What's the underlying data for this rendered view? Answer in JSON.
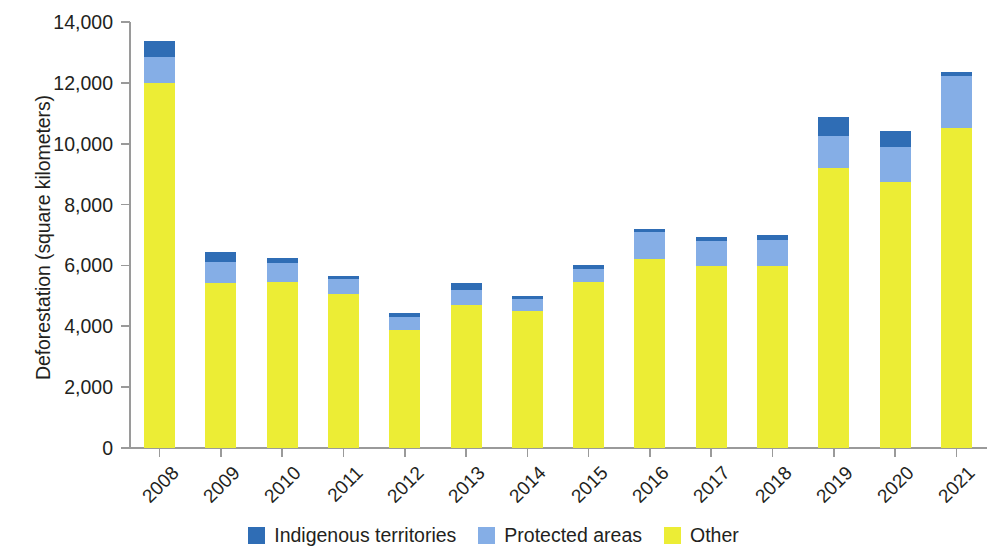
{
  "chart_data": {
    "type": "bar",
    "subtype": "stacked-vertical",
    "title": "",
    "xlabel": "",
    "ylabel": "Deforestation (square kilometers)",
    "ylim": [
      0,
      14000
    ],
    "ytick_step": 2000,
    "yticks": [
      0,
      2000,
      4000,
      6000,
      8000,
      10000,
      12000,
      14000
    ],
    "ytick_labels": [
      "0",
      "2,000",
      "4,000",
      "6,000",
      "8,000",
      "10,000",
      "12,000",
      "14,000"
    ],
    "grid": false,
    "legend_position": "bottom-center",
    "categories": [
      "2008",
      "2009",
      "2010",
      "2011",
      "2012",
      "2013",
      "2014",
      "2015",
      "2016",
      "2017",
      "2018",
      "2019",
      "2020",
      "2021"
    ],
    "series": [
      {
        "name": "Other",
        "color": "#eced35",
        "values": [
          11990,
          5420,
          5450,
          5050,
          3880,
          4700,
          4500,
          5450,
          6210,
          5980,
          5980,
          9200,
          8740,
          10510
        ]
      },
      {
        "name": "Protected areas",
        "color": "#85aee6",
        "values": [
          860,
          690,
          640,
          500,
          420,
          500,
          400,
          440,
          900,
          820,
          850,
          1060,
          1160,
          1700
        ]
      },
      {
        "name": "Indigenous territories",
        "color": "#2f6db5",
        "values": [
          525,
          330,
          170,
          100,
          135,
          220,
          110,
          125,
          90,
          140,
          170,
          620,
          520,
          150
        ]
      }
    ],
    "stack_order_bottom_to_top": [
      "Other",
      "Protected areas",
      "Indigenous territories"
    ],
    "totals": [
      13375,
      6440,
      6260,
      5650,
      4435,
      5420,
      5010,
      6015,
      7200,
      6940,
      7000,
      10880,
      10420,
      12360
    ],
    "legend": [
      {
        "label": "Indigenous territories",
        "color": "#2f6db5"
      },
      {
        "label": "Protected areas",
        "color": "#85aee6"
      },
      {
        "label": "Other",
        "color": "#eced35"
      }
    ]
  }
}
